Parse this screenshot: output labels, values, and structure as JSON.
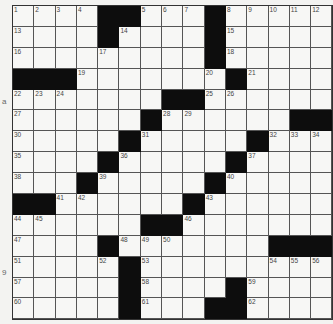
{
  "puzzle": {
    "rows": 15,
    "cols": 15,
    "grid": [
      [
        "1",
        "2",
        "3",
        "4",
        "#",
        "#",
        "5",
        "6",
        "7",
        "#",
        "8",
        "9",
        "10",
        "11",
        "12"
      ],
      [
        "13",
        "",
        "",
        "",
        "#",
        "14",
        "",
        "",
        "",
        "#",
        "15",
        "",
        "",
        "",
        ""
      ],
      [
        "16",
        "",
        "",
        "",
        "17",
        "",
        "",
        "",
        "",
        "#",
        "18",
        "",
        "",
        "",
        ""
      ],
      [
        "#",
        "#",
        "#",
        "19",
        "",
        "",
        "",
        "",
        "",
        "20",
        "#",
        "21",
        "",
        "",
        ""
      ],
      [
        "22",
        "23",
        "24",
        "",
        "",
        "",
        "",
        "#",
        "#",
        "25",
        "26",
        "",
        "",
        "",
        ""
      ],
      [
        "27",
        "",
        "",
        "",
        "",
        "",
        "#",
        "28",
        "29",
        "",
        "",
        "",
        "",
        "#",
        "#"
      ],
      [
        "30",
        "",
        "",
        "",
        "",
        "#",
        "31",
        "",
        "",
        "",
        "",
        "#",
        "32",
        "33",
        "34"
      ],
      [
        "35",
        "",
        "",
        "",
        "#",
        "36",
        "",
        "",
        "",
        "",
        "#",
        "37",
        "",
        "",
        ""
      ],
      [
        "38",
        "",
        "",
        "#",
        "39",
        "",
        "",
        "",
        "",
        "#",
        "40",
        "",
        "",
        "",
        ""
      ],
      [
        "#",
        "#",
        "41",
        "42",
        "",
        "",
        "",
        "",
        "#",
        "43",
        "",
        "",
        "",
        "",
        ""
      ],
      [
        "44",
        "45",
        "",
        "",
        "",
        "",
        "#",
        "#",
        "46",
        "",
        "",
        "",
        "",
        "",
        ""
      ],
      [
        "47",
        "",
        "",
        "",
        "#",
        "48",
        "49",
        "50",
        "",
        "",
        "",
        "",
        "#",
        "#",
        "#"
      ],
      [
        "51",
        "",
        "",
        "",
        "52",
        "#",
        "53",
        "",
        "",
        "",
        "",
        "",
        "54",
        "55",
        "56"
      ],
      [
        "57",
        "",
        "",
        "",
        "",
        "#",
        "58",
        "",
        "",
        "",
        "#",
        "59",
        "",
        "",
        ""
      ],
      [
        "60",
        "",
        "",
        "",
        "",
        "#",
        "61",
        "",
        "",
        "#",
        "#",
        "62",
        "",
        "",
        ""
      ]
    ]
  },
  "margin_marks": [
    {
      "text": "a",
      "x": 2,
      "y": 97
    },
    {
      "text": "9",
      "x": 2,
      "y": 268
    }
  ]
}
